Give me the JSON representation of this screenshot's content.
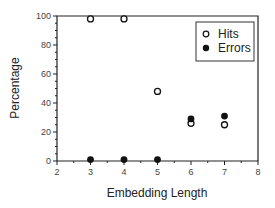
{
  "chart_data": {
    "type": "scatter",
    "title": "",
    "xlabel": "Embedding Length",
    "ylabel": "Percentage",
    "xlim": [
      2,
      8
    ],
    "ylim": [
      0,
      100
    ],
    "xticks": [
      "2",
      "3",
      "4",
      "5",
      "6",
      "7",
      "8"
    ],
    "yticks": [
      "0",
      "20",
      "40",
      "60",
      "80",
      "100"
    ],
    "grid": false,
    "legend_position": "upper right",
    "series": [
      {
        "name": "Hits",
        "marker": "open-circle",
        "x": [
          3,
          4,
          5,
          6,
          7
        ],
        "y": [
          98,
          98,
          48,
          26,
          25
        ]
      },
      {
        "name": "Errors",
        "marker": "filled-circle",
        "x": [
          3,
          4,
          5,
          6,
          7
        ],
        "y": [
          1,
          1,
          1,
          29,
          31
        ]
      }
    ]
  },
  "legend": {
    "hits": "Hits",
    "errors": "Errors"
  }
}
